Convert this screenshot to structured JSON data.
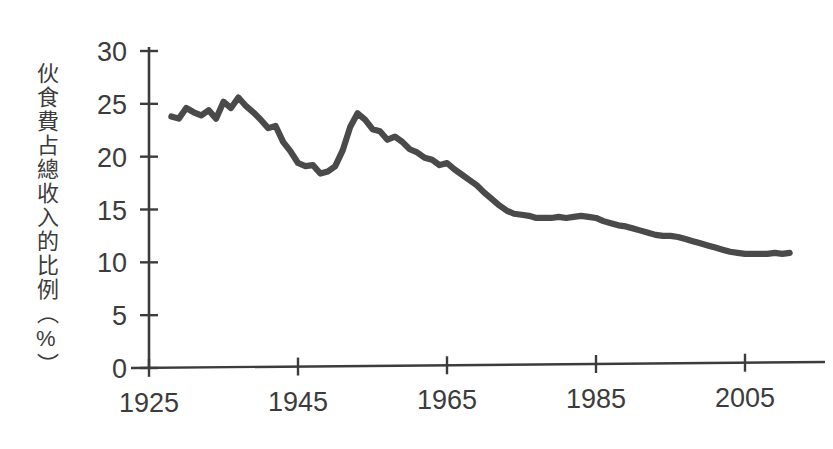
{
  "chart_data": {
    "type": "line",
    "title": "",
    "subtitle": "",
    "xlabel": "",
    "ylabel": "伙食費占總收入的比例（%）",
    "xlim": [
      1925,
      2013
    ],
    "ylim": [
      0,
      30
    ],
    "xticks": [
      1925,
      1945,
      1965,
      1985,
      2005
    ],
    "xtick_labels": [
      "1925",
      "1945",
      "1965",
      "1985",
      "2005"
    ],
    "yticks": [
      0,
      5,
      10,
      15,
      20,
      25,
      30
    ],
    "ytick_labels": [
      "0",
      "5",
      "10",
      "15",
      "20",
      "25",
      "30"
    ],
    "grid": false,
    "legend": null,
    "legend_position": "none",
    "line_color": "#4a4a4a",
    "axis_color": "#3c3c3c",
    "series": [
      {
        "name": "伙食費占總收入的比例",
        "units": "%",
        "x": [
          1928,
          1929,
          1930,
          1931,
          1932,
          1933,
          1934,
          1935,
          1936,
          1937,
          1938,
          1939,
          1940,
          1941,
          1942,
          1943,
          1944,
          1945,
          1946,
          1947,
          1948,
          1949,
          1950,
          1951,
          1952,
          1953,
          1954,
          1955,
          1956,
          1957,
          1958,
          1959,
          1960,
          1961,
          1962,
          1963,
          1964,
          1965,
          1966,
          1967,
          1968,
          1969,
          1970,
          1971,
          1972,
          1973,
          1974,
          1975,
          1976,
          1977,
          1978,
          1979,
          1980,
          1981,
          1982,
          1983,
          1984,
          1985,
          1986,
          1987,
          1988,
          1989,
          1990,
          1991,
          1992,
          1993,
          1994,
          1995,
          1996,
          1997,
          1998,
          1999,
          2000,
          2001,
          2002,
          2003,
          2004,
          2005,
          2006,
          2007,
          2008,
          2009,
          2010,
          2011
        ],
        "y": [
          23.8,
          23.6,
          24.6,
          24.2,
          23.9,
          24.4,
          23.6,
          25.2,
          24.6,
          25.6,
          24.8,
          24.2,
          23.5,
          22.7,
          22.9,
          21.4,
          20.5,
          19.4,
          19.1,
          19.2,
          18.4,
          18.6,
          19.1,
          20.6,
          22.8,
          24.1,
          23.5,
          22.6,
          22.4,
          21.6,
          21.9,
          21.4,
          20.7,
          20.4,
          19.9,
          19.7,
          19.2,
          19.4,
          18.8,
          18.3,
          17.8,
          17.3,
          16.6,
          16.0,
          15.4,
          14.9,
          14.6,
          14.5,
          14.4,
          14.2,
          14.2,
          14.2,
          14.3,
          14.2,
          14.3,
          14.4,
          14.3,
          14.2,
          13.9,
          13.7,
          13.5,
          13.4,
          13.2,
          13.0,
          12.8,
          12.6,
          12.5,
          12.5,
          12.4,
          12.2,
          12.0,
          11.8,
          11.6,
          11.4,
          11.2,
          11.0,
          10.9,
          10.8,
          10.8,
          10.8,
          10.8,
          10.9,
          10.8,
          10.9
        ]
      }
    ]
  },
  "axis": {
    "y_label_text": "伙食費占總收入的比例（%）"
  }
}
